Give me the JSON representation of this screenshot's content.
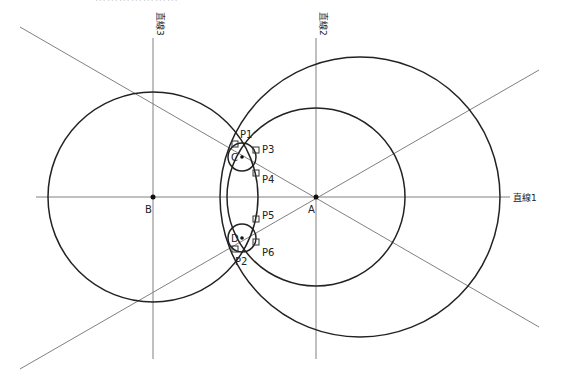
{
  "caption": "⋯⋯⋯⋯⋯⋯⋯",
  "colors": {
    "line": "#777777",
    "circle": "#222222",
    "text": "#222222",
    "background": "#ffffff"
  },
  "line_labels": {
    "line1": "直線1",
    "line2": "直線2",
    "line3": "直線3"
  },
  "points": {
    "A": {
      "label": "A",
      "x": 316,
      "y": 197
    },
    "B": {
      "label": "B",
      "x": 153,
      "y": 197
    },
    "C": {
      "label": "C",
      "x": 242,
      "y": 157
    },
    "D": {
      "label": "D",
      "x": 242,
      "y": 238
    }
  },
  "tangent_points": [
    {
      "label": "P1",
      "x": 236,
      "y": 146
    },
    {
      "label": "P3",
      "x": 256,
      "y": 152
    },
    {
      "label": "P4",
      "x": 256,
      "y": 174
    },
    {
      "label": "P5",
      "x": 256,
      "y": 220
    },
    {
      "label": "P6",
      "x": 256,
      "y": 242
    },
    {
      "label": "P2",
      "x": 236,
      "y": 248
    }
  ],
  "circles": [
    {
      "name": "circle-b",
      "cx": 153,
      "cy": 197,
      "r": 105
    },
    {
      "name": "circle-a-inner",
      "cx": 316,
      "cy": 197,
      "r": 89
    },
    {
      "name": "circle-large",
      "cx": 360,
      "cy": 197,
      "r": 140
    },
    {
      "name": "circle-c",
      "cx": 242,
      "cy": 157,
      "r": 14
    },
    {
      "name": "circle-d",
      "cx": 242,
      "cy": 238,
      "r": 14
    }
  ]
}
